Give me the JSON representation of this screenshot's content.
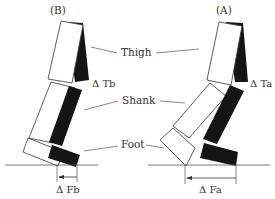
{
  "figure": {
    "panels": [
      {
        "id": "B",
        "title": "(B)",
        "thigh_delta_label": "Δ Tb",
        "foot_delta_label": "Δ Fb"
      },
      {
        "id": "A",
        "title": "(A)",
        "thigh_delta_label": "Δ Ta",
        "foot_delta_label": "Δ Fa"
      }
    ],
    "segment_labels": {
      "thigh": "Thigh",
      "shank": "Shank",
      "foot": "Foot"
    },
    "colors": {
      "outline": "#333333",
      "fill_black": "#151515",
      "line": "#555555",
      "text": "#333333"
    }
  }
}
